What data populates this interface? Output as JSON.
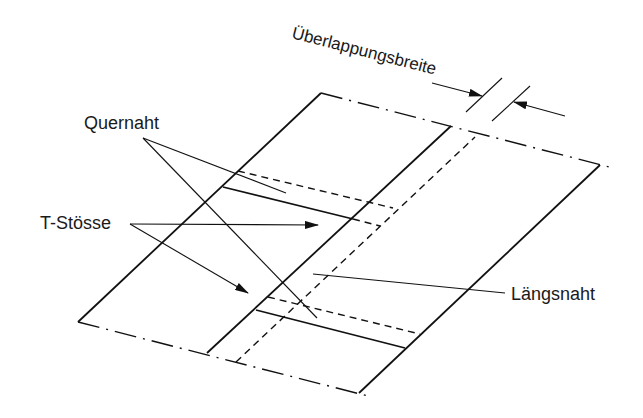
{
  "diagram": {
    "labels": {
      "overlap_width": "Überlappungsbreite",
      "cross_seam": "Quernaht",
      "t_joints": "T-Stösse",
      "longitudinal_seam": "Längsnaht"
    },
    "line_styles": {
      "outline": "solid",
      "hidden_edge": "dashed",
      "open_end": "dash-dot"
    },
    "colors": {
      "ink": "#111111",
      "background": "#ffffff"
    }
  }
}
